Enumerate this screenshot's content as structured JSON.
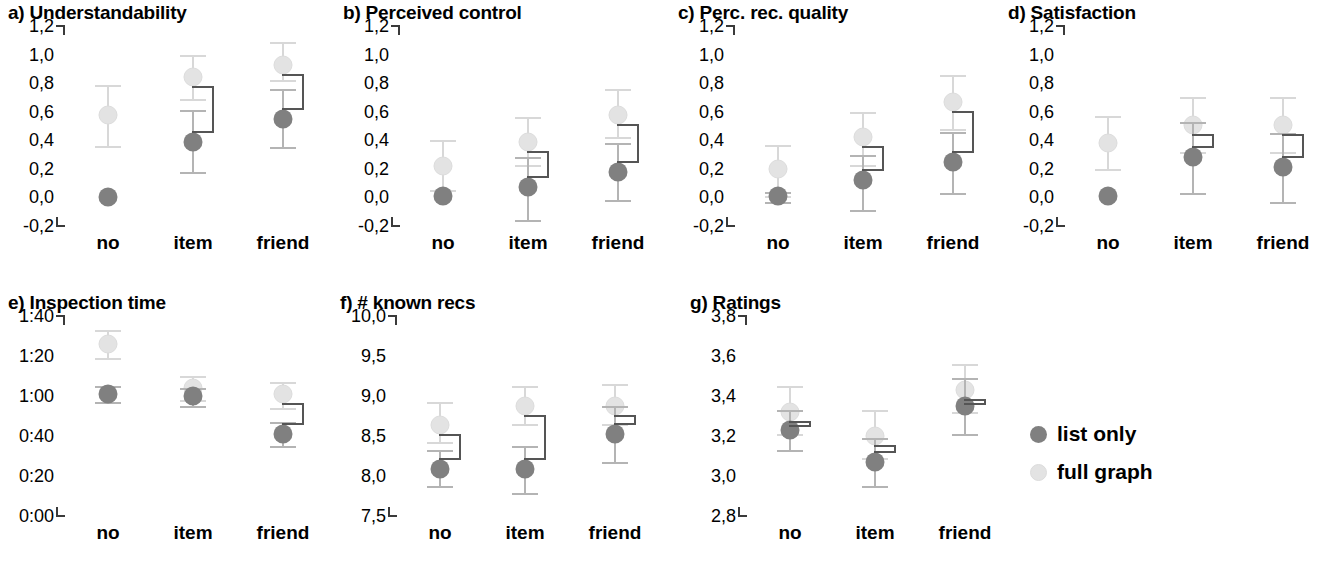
{
  "figure": {
    "width": 1330,
    "height": 572,
    "background": "#ffffff"
  },
  "legend": {
    "position": "right-middle",
    "entries": [
      {
        "label": "list only",
        "color": "#808080",
        "key": "list_only"
      },
      {
        "label": "full graph",
        "color": "#e3e3e3",
        "key": "full_graph"
      }
    ]
  },
  "chart_data": [
    {
      "id": "a",
      "type": "scatter",
      "title": "a) Understandability",
      "xlabel": "",
      "ylabel": "",
      "categories": [
        "no",
        "item",
        "friend"
      ],
      "ylim": [
        -0.2,
        1.2
      ],
      "yticks": [
        "1,2",
        "1,0",
        "0,8",
        "0,6",
        "0,4",
        "0,2",
        "0,0",
        "-0,2"
      ],
      "ytick_values": [
        1.2,
        1.0,
        0.8,
        0.6,
        0.4,
        0.2,
        0.0,
        -0.2
      ],
      "grid": false,
      "series": [
        {
          "name": "list only",
          "values": [
            0.0,
            0.39,
            0.55
          ],
          "err_low": [
            0.0,
            0.18,
            0.35
          ],
          "err_high": [
            0.0,
            0.61,
            0.76
          ]
        },
        {
          "name": "full graph",
          "values": [
            0.58,
            0.84,
            0.93
          ],
          "err_low": [
            0.36,
            0.69,
            0.82
          ],
          "err_high": [
            0.79,
            1.0,
            1.09
          ]
        }
      ],
      "significance": [
        false,
        true,
        true
      ]
    },
    {
      "id": "b",
      "type": "scatter",
      "title": "b) Perceived control",
      "xlabel": "",
      "ylabel": "",
      "categories": [
        "no",
        "item",
        "friend"
      ],
      "ylim": [
        -0.2,
        1.2
      ],
      "yticks": [
        "1,2",
        "1,0",
        "0,8",
        "0,6",
        "0,4",
        "0,2",
        "0,0",
        "-0,2"
      ],
      "ytick_values": [
        1.2,
        1.0,
        0.8,
        0.6,
        0.4,
        0.2,
        0.0,
        -0.2
      ],
      "grid": false,
      "series": [
        {
          "name": "list only",
          "values": [
            0.01,
            0.07,
            0.18
          ],
          "err_low": [
            0.01,
            -0.16,
            -0.02
          ],
          "err_high": [
            0.01,
            0.28,
            0.38
          ]
        },
        {
          "name": "full graph",
          "values": [
            0.22,
            0.39,
            0.58
          ],
          "err_low": [
            0.05,
            0.23,
            0.42
          ],
          "err_high": [
            0.4,
            0.56,
            0.76
          ]
        }
      ],
      "significance": [
        false,
        true,
        true
      ]
    },
    {
      "id": "c",
      "type": "scatter",
      "title": "c) Perc. rec. quality",
      "xlabel": "",
      "ylabel": "",
      "categories": [
        "no",
        "item",
        "friend"
      ],
      "ylim": [
        -0.2,
        1.2
      ],
      "yticks": [
        "1,2",
        "1,0",
        "0,8",
        "0,6",
        "0,4",
        "0,2",
        "0,0",
        "-0,2"
      ],
      "ytick_values": [
        1.2,
        1.0,
        0.8,
        0.6,
        0.4,
        0.2,
        0.0,
        -0.2
      ],
      "grid": false,
      "series": [
        {
          "name": "list only",
          "values": [
            0.01,
            0.12,
            0.25
          ],
          "err_low": [
            -0.03,
            -0.09,
            0.03
          ],
          "err_high": [
            0.04,
            0.3,
            0.46
          ]
        },
        {
          "name": "full graph",
          "values": [
            0.2,
            0.42,
            0.67
          ],
          "err_low": [
            0.01,
            0.23,
            0.48
          ],
          "err_high": [
            0.37,
            0.6,
            0.86
          ]
        }
      ],
      "significance": [
        false,
        true,
        true
      ]
    },
    {
      "id": "d",
      "type": "scatter",
      "title": "d) Satisfaction",
      "xlabel": "",
      "ylabel": "",
      "categories": [
        "no",
        "item",
        "friend"
      ],
      "ylim": [
        -0.2,
        1.2
      ],
      "yticks": [
        "1,2",
        "1,0",
        "0,8",
        "0,6",
        "0,4",
        "0,2",
        "0,0",
        "-0,2"
      ],
      "ytick_values": [
        1.2,
        1.0,
        0.8,
        0.6,
        0.4,
        0.2,
        0.0,
        -0.2
      ],
      "grid": false,
      "series": [
        {
          "name": "list only",
          "values": [
            0.01,
            0.28,
            0.21
          ],
          "err_low": [
            0.01,
            0.03,
            -0.03
          ],
          "err_high": [
            0.01,
            0.53,
            0.45
          ]
        },
        {
          "name": "full graph",
          "values": [
            0.38,
            0.51,
            0.51
          ],
          "err_low": [
            0.2,
            0.32,
            0.32
          ],
          "err_high": [
            0.57,
            0.7,
            0.7
          ]
        }
      ],
      "significance": [
        false,
        true,
        true
      ]
    },
    {
      "id": "e",
      "type": "scatter",
      "title": "e) Inspection time",
      "xlabel": "",
      "ylabel": "",
      "categories": [
        "no",
        "item",
        "friend"
      ],
      "ylim": [
        0,
        100
      ],
      "yticks": [
        "1:40",
        "1:20",
        "1:00",
        "0:40",
        "0:20",
        "0:00"
      ],
      "ytick_values": [
        100,
        80,
        60,
        40,
        20,
        0
      ],
      "grid": false,
      "series": [
        {
          "name": "list only",
          "values": [
            61,
            60,
            41
          ],
          "err_low": [
            57,
            55,
            35
          ],
          "err_high": [
            65,
            64,
            47
          ]
        },
        {
          "name": "full graph",
          "values": [
            86,
            64,
            61
          ],
          "err_low": [
            79,
            58,
            54
          ],
          "err_high": [
            93,
            70,
            67
          ]
        }
      ],
      "significance": [
        false,
        false,
        true
      ]
    },
    {
      "id": "f",
      "type": "scatter",
      "title": "f) # known recs",
      "xlabel": "",
      "ylabel": "",
      "categories": [
        "no",
        "item",
        "friend"
      ],
      "ylim": [
        7.5,
        10.0
      ],
      "yticks": [
        "10,0",
        "9,5",
        "9,0",
        "8,5",
        "8,0",
        "7,5"
      ],
      "ytick_values": [
        10.0,
        9.5,
        9.0,
        8.5,
        8.0,
        7.5
      ],
      "grid": false,
      "series": [
        {
          "name": "list only",
          "values": [
            8.09,
            8.09,
            8.52
          ],
          "err_low": [
            7.87,
            7.79,
            8.17
          ],
          "err_high": [
            8.32,
            8.38,
            8.87
          ]
        },
        {
          "name": "full graph",
          "values": [
            8.64,
            8.88,
            8.88
          ],
          "err_low": [
            8.43,
            8.65,
            8.65
          ],
          "err_high": [
            8.93,
            9.12,
            9.15
          ]
        }
      ],
      "significance": [
        true,
        true,
        true
      ]
    },
    {
      "id": "g",
      "type": "scatter",
      "title": "g) Ratings",
      "xlabel": "",
      "ylabel": "",
      "categories": [
        "no",
        "item",
        "friend"
      ],
      "ylim": [
        2.8,
        3.8
      ],
      "yticks": [
        "3,8",
        "3,6",
        "3,4",
        "3,2",
        "3,0",
        "2,8"
      ],
      "ytick_values": [
        3.8,
        3.6,
        3.4,
        3.2,
        3.0,
        2.8
      ],
      "grid": false,
      "series": [
        {
          "name": "list only",
          "values": [
            3.23,
            3.07,
            3.35
          ],
          "err_low": [
            3.13,
            2.95,
            3.21
          ],
          "err_high": [
            3.33,
            3.19,
            3.49
          ]
        },
        {
          "name": "full graph",
          "values": [
            3.32,
            3.2,
            3.43
          ],
          "err_low": [
            3.21,
            3.09,
            3.32
          ],
          "err_high": [
            3.45,
            3.33,
            3.56
          ]
        }
      ],
      "significance": [
        true,
        true,
        true
      ]
    }
  ]
}
